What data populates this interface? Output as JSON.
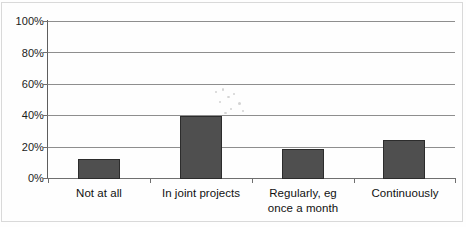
{
  "chart_data": {
    "type": "bar",
    "title": "",
    "subtitle": "",
    "xlabel": "",
    "ylabel": "",
    "categories": [
      "Not at all",
      "In joint projects",
      "Regularly, eg\nonce a month",
      "Continuously"
    ],
    "category_lines": [
      [
        "Not at all"
      ],
      [
        "In joint projects"
      ],
      [
        "Regularly, eg",
        "once a month"
      ],
      [
        "Continuously"
      ]
    ],
    "values": [
      13,
      40,
      19,
      25
    ],
    "value_labels": [
      "13%",
      "40%",
      "19%",
      "25%"
    ],
    "ylim": [
      0,
      100
    ],
    "ytick_values": [
      0,
      20,
      40,
      60,
      80,
      100
    ],
    "ytick_labels": [
      "0%",
      "20%",
      "40%",
      "60%",
      "80%",
      "100%"
    ],
    "grid": true,
    "legend": false,
    "legend_position": "none",
    "bar_color": "#4f4f4f",
    "bar_border_color": "#2c2c2c",
    "gridline_color": "#8e8e8e",
    "axis_color": "#5e5e5e",
    "text_color": "#111111",
    "background_color": "#ffffff"
  }
}
